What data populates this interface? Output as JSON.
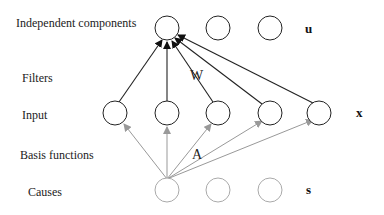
{
  "labels": {
    "independent_components": "Independent components",
    "filters": "Filters",
    "input": "Input",
    "basis_functions": "Basis functions",
    "causes": "Causes"
  },
  "variables": {
    "u": "u",
    "x": "x",
    "s": "s"
  },
  "matrices": {
    "W": "W",
    "A": "A"
  },
  "colors": {
    "dark": "#222222",
    "gray": "#999999"
  }
}
